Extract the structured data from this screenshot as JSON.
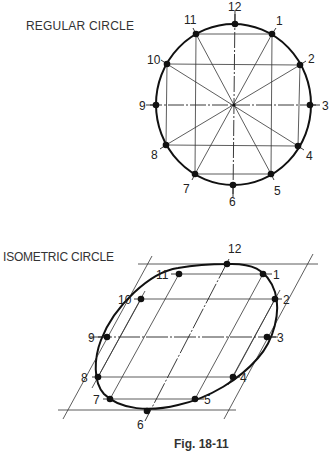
{
  "figure": {
    "caption": "Fig. 18-11",
    "regular": {
      "title": "REGULAR CIRCLE",
      "points": [
        {
          "n": "12",
          "x": 235,
          "y": 24
        },
        {
          "n": "1",
          "x": 272,
          "y": 34
        },
        {
          "n": "2",
          "x": 300,
          "y": 65
        },
        {
          "n": "3",
          "x": 310,
          "y": 105
        },
        {
          "n": "4",
          "x": 298,
          "y": 146
        },
        {
          "n": "5",
          "x": 271,
          "y": 174
        },
        {
          "n": "6",
          "x": 233,
          "y": 185
        },
        {
          "n": "7",
          "x": 195,
          "y": 174
        },
        {
          "n": "8",
          "x": 166,
          "y": 145
        },
        {
          "n": "9",
          "x": 156,
          "y": 105
        },
        {
          "n": "10",
          "x": 167,
          "y": 64
        },
        {
          "n": "11",
          "x": 196,
          "y": 34
        }
      ]
    },
    "isometric": {
      "title": "ISOMETRIC CIRCLE",
      "points": [
        {
          "n": "12",
          "x": 227,
          "y": 264
        },
        {
          "n": "1",
          "x": 263,
          "y": 274
        },
        {
          "n": "2",
          "x": 275,
          "y": 299
        },
        {
          "n": "3",
          "x": 267,
          "y": 337
        },
        {
          "n": "4",
          "x": 233,
          "y": 376
        },
        {
          "n": "5",
          "x": 195,
          "y": 399
        },
        {
          "n": "6",
          "x": 147,
          "y": 411
        },
        {
          "n": "7",
          "x": 110,
          "y": 399
        },
        {
          "n": "8",
          "x": 98,
          "y": 377
        },
        {
          "n": "9",
          "x": 107,
          "y": 337
        },
        {
          "n": "10",
          "x": 141,
          "y": 299
        },
        {
          "n": "11",
          "x": 179,
          "y": 274
        }
      ]
    },
    "colors": {
      "ink": "#111111",
      "thin": "#333333",
      "paper": "#ffffff"
    }
  }
}
